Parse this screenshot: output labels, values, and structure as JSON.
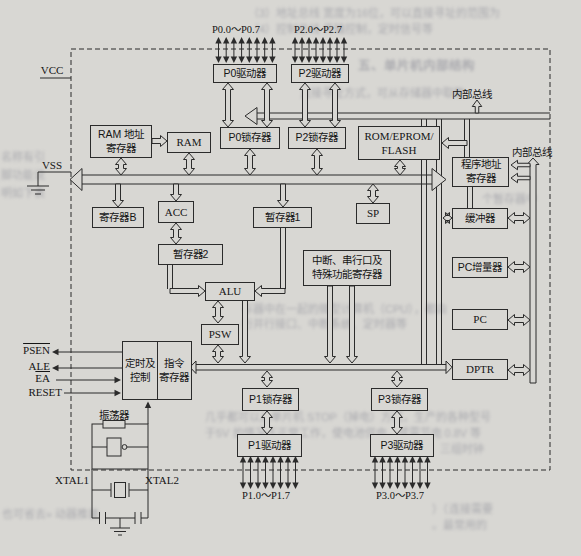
{
  "power": {
    "vcc": "VCC",
    "vss": "VSS"
  },
  "ports": {
    "p0": "P0.0～P0.7",
    "p2": "P2.0～P2.7",
    "p1": "P1.0～P1.7",
    "p3": "P3.0～P3.7"
  },
  "buses": {
    "top": "内部总线",
    "right": "内部总线"
  },
  "signals": {
    "psen": "PSEN",
    "ale": "ALE",
    "ea": "EA",
    "reset": "RESET"
  },
  "clock": {
    "oscillator": "振荡器",
    "xtal1": "XTAL1",
    "xtal2": "XTAL2"
  },
  "blocks": {
    "p0_driver": "P0驱动器",
    "p2_driver": "P2驱动器",
    "p1_driver": "P1驱动器",
    "p3_driver": "P3驱动器",
    "p0_latch": "P0锁存器",
    "p2_latch": "P2锁存器",
    "p1_latch": "P1锁存器",
    "p3_latch": "P3锁存器",
    "ram": "RAM",
    "ram_addr_line1": "RAM 地址",
    "ram_addr_line2": "寄存器",
    "rom_line1": "ROM/EPROM/",
    "rom_line2": "FLASH",
    "prog_addr_line1": "程序地址",
    "prog_addr_line2": "寄存器",
    "reg_b": "寄存器B",
    "acc": "ACC",
    "temp1": "暂存器1",
    "temp2": "暂存器2",
    "sp": "SP",
    "buffer": "缓冲器",
    "pc_inc": "PC增量器",
    "pc": "PC",
    "dptr": "DPTR",
    "alu": "ALU",
    "psw": "PSW",
    "interrupt_line1": "中断、串行口及",
    "interrupt_line2": "特殊功能寄存器",
    "timing_line1": "定时及",
    "timing_line2": "控制",
    "ir_line1": "指令",
    "ir_line2": "寄存器"
  },
  "bleed": [
    "（3）地址总线 宽度为16位，可以直接寻址的范围为",
    "（4）控制总线 传输控制，定时信号等",
    "五、单片机内部结构",
    "直接寻址方式，可从存储器中取数",
    "名称有引",
    "脚功能说",
    "明如下表",
    "个暂存器中",
    "存器中在一起的微型计算机（CPU），都由",
    "行并行接口、中断系统、定时器等",
    "几乎都可以从单片机 STOP（掉电）方式，生产的各种型号",
    "于5V 的情况下正常工作，使电池供电，或需节电 0.8V 等",
    "三组时钟",
    "也可省去» 动器推装",
    "）（连接需要",
    "。最常用的"
  ]
}
